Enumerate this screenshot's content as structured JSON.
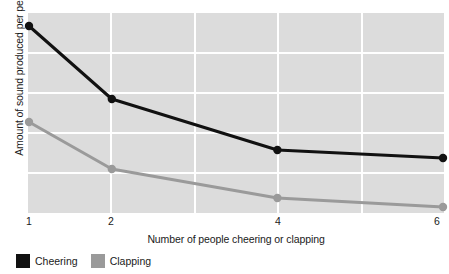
{
  "chart_data": {
    "type": "line",
    "title": "",
    "xlabel": "Number of people cheering or clapping",
    "ylabel": "Amount of sound produced per person",
    "x": [
      1,
      2,
      4,
      6
    ],
    "xtick_labels": [
      "1",
      "2",
      "4",
      "6"
    ],
    "ytick_labels": [],
    "grid": true,
    "legend_position": "bottom-left",
    "xlim": [
      1,
      6
    ],
    "ylim": [
      0,
      10
    ],
    "series": [
      {
        "name": "Cheering",
        "color": "#111111",
        "values": [
          9.35,
          5.7,
          3.15,
          2.75
        ]
      },
      {
        "name": "Clapping",
        "color": "#9a9a9a",
        "values": [
          4.55,
          2.2,
          0.75,
          0.3
        ]
      }
    ]
  },
  "axes": {
    "y_title": "Amount of sound produced per person",
    "x_title": "Number of people cheering or clapping",
    "x_ticks": [
      "1",
      "2",
      "4",
      "6"
    ]
  },
  "legend": {
    "items": [
      {
        "label": "Cheering",
        "color": "#111111"
      },
      {
        "label": "Clapping",
        "color": "#9a9a9a"
      }
    ]
  },
  "colors": {
    "plot_background": "#dcdcdc",
    "gridline": "#ffffff",
    "page_background": "#ffffff",
    "text": "#1a1a1a",
    "cheering": "#111111",
    "clapping": "#9a9a9a"
  }
}
